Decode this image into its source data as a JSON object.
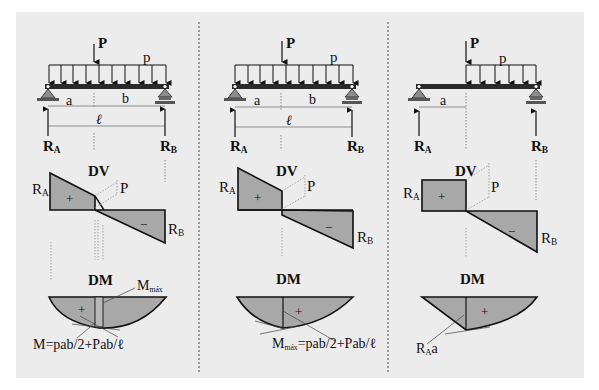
{
  "colors": {
    "background": "#ffffff",
    "panel": "#ececec",
    "fill": "#a8a8a8",
    "line": "#111111",
    "beam": "#2a2a2a",
    "support": "#8c8c8c",
    "guide": "#777777",
    "separator": "#444444"
  },
  "labels": {
    "point_load": "P",
    "distributed_load": "p",
    "span_a": "a",
    "span_b": "b",
    "span_length": "ℓ",
    "reaction_a_main": "R",
    "reaction_a_sub": "A",
    "reaction_b_main": "R",
    "reaction_b_sub": "B",
    "shear_diagram": "DV",
    "moment_diagram": "DM",
    "plus": "+",
    "minus": "−",
    "p_jump": "P"
  },
  "panels": [
    {
      "id": "case-1",
      "description": "Full distributed load p plus point load P at distance a",
      "load_extent": "full",
      "mmax_label_main": "M",
      "mmax_label_sub": "máx",
      "moment_formula": "M=pab/2+Pab/ℓ"
    },
    {
      "id": "case-2",
      "description": "Full distributed load p plus point load P; max moment under P",
      "load_extent": "full",
      "moment_formula_main": "M",
      "moment_formula_sub": "máx",
      "moment_formula_rest": "=pab/2+Pab/ℓ"
    },
    {
      "id": "case-3",
      "description": "Point load P at distance a; distributed load p only from P to right support",
      "load_extent": "partial",
      "moment_label_main": "R",
      "moment_label_sub": "A",
      "moment_label_rest": "a"
    }
  ]
}
